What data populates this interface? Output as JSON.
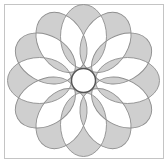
{
  "figure": {
    "frame": {
      "x": 4,
      "y": 4,
      "width": 159,
      "height": 154,
      "stroke": "#c4c4c4"
    },
    "center": {
      "x": 83.5,
      "y": 80.5
    },
    "petals": {
      "count": 12,
      "rotation_step_deg": 30,
      "ellipse_center_radius": 44,
      "semi_major": 32,
      "semi_minor": 23,
      "fill": "#cfcfcf",
      "stroke": "#8e8e8e",
      "fill_rule": "evenodd"
    },
    "inner_circle": {
      "r": 12,
      "fill": "#ffffff",
      "stroke": "#555555"
    }
  }
}
